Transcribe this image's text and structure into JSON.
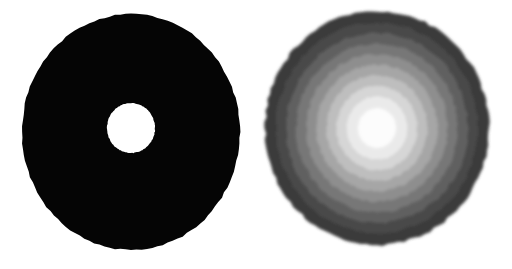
{
  "figure": {
    "width": 512,
    "height": 269,
    "background_color": "#ffffff",
    "panel_count": 2
  },
  "chart_data": {
    "type": "heatmap",
    "xlabel": "",
    "ylabel": "",
    "grid": false,
    "legend": "none",
    "panels": [
      {
        "name": "left-panel",
        "label": "solid-annulus",
        "type": "annulus",
        "outer_circle": {
          "center_x": 131,
          "center_y": 132,
          "radius_x": 109,
          "radius_y": 118,
          "fill": "#050505"
        },
        "inner_hole": {
          "center_x": 131,
          "center_y": 128,
          "radius_x": 24,
          "radius_y": 25,
          "fill": "#ffffff"
        },
        "values": [
          0,
          1
        ],
        "categories": [
          "disc",
          "hole"
        ]
      },
      {
        "name": "right-panel",
        "label": "banded-radial-disc",
        "type": "concentric-bands",
        "center_x": 121,
        "center_y": 128,
        "outer_radius_x": 112,
        "outer_radius_y": 117,
        "band_count": 10,
        "bands": [
          {
            "index": 0,
            "radius_fraction": 1.0,
            "gray_value": 58,
            "color": "#3a3a3a"
          },
          {
            "index": 1,
            "radius_fraction": 0.9,
            "gray_value": 74,
            "color": "#4a4a4a"
          },
          {
            "index": 2,
            "radius_fraction": 0.81,
            "gray_value": 96,
            "color": "#606060"
          },
          {
            "index": 3,
            "radius_fraction": 0.72,
            "gray_value": 119,
            "color": "#777777"
          },
          {
            "index": 4,
            "radius_fraction": 0.63,
            "gray_value": 142,
            "color": "#8e8e8e"
          },
          {
            "index": 5,
            "radius_fraction": 0.54,
            "gray_value": 166,
            "color": "#a6a6a6"
          },
          {
            "index": 6,
            "radius_fraction": 0.45,
            "gray_value": 190,
            "color": "#bebebe"
          },
          {
            "index": 7,
            "radius_fraction": 0.36,
            "gray_value": 214,
            "color": "#d6d6d6"
          },
          {
            "index": 8,
            "radius_fraction": 0.27,
            "gray_value": 234,
            "color": "#eaeaea"
          },
          {
            "index": 9,
            "radius_fraction": 0.17,
            "gray_value": 252,
            "color": "#fcfcfc"
          }
        ],
        "radius_fractions": [
          1.0,
          0.9,
          0.81,
          0.72,
          0.63,
          0.54,
          0.45,
          0.36,
          0.27,
          0.17
        ],
        "values": [
          58,
          74,
          96,
          119,
          142,
          166,
          190,
          214,
          234,
          252
        ]
      }
    ]
  }
}
